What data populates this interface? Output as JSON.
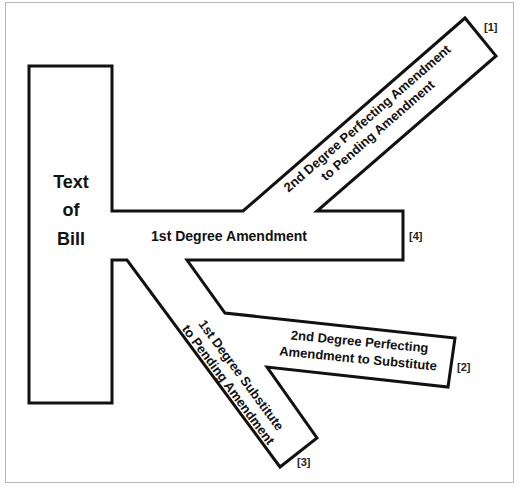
{
  "diagram": {
    "type": "amendment-tree",
    "stroke_color": "#111111",
    "frame_color": "#b8b8b8",
    "outline_points": "29,66 112,66 112,211 243,211 465,18 496,56 317,211 403,211 403,260 187,260 225,313 455,338 448,387 267,367 317,438 280,467 127,260 112,260 112,403 29,403",
    "bill": {
      "lines": [
        "Text",
        "of",
        "Bill"
      ]
    },
    "first_degree_amendment": {
      "label": "1st Degree Amendment",
      "note": "[4]"
    },
    "second_degree_to_pending": {
      "lines": [
        "2nd Degree Perfecting Amendment",
        "to Pending Amendment"
      ],
      "note": "[1]"
    },
    "second_degree_to_substitute": {
      "lines": [
        "2nd Degree Perfecting",
        "Amendment to Substitute"
      ],
      "note": "[2]"
    },
    "first_degree_substitute": {
      "lines": [
        "1st Degree Substitute",
        "to Pending Amendment"
      ],
      "note": "[3]"
    }
  }
}
